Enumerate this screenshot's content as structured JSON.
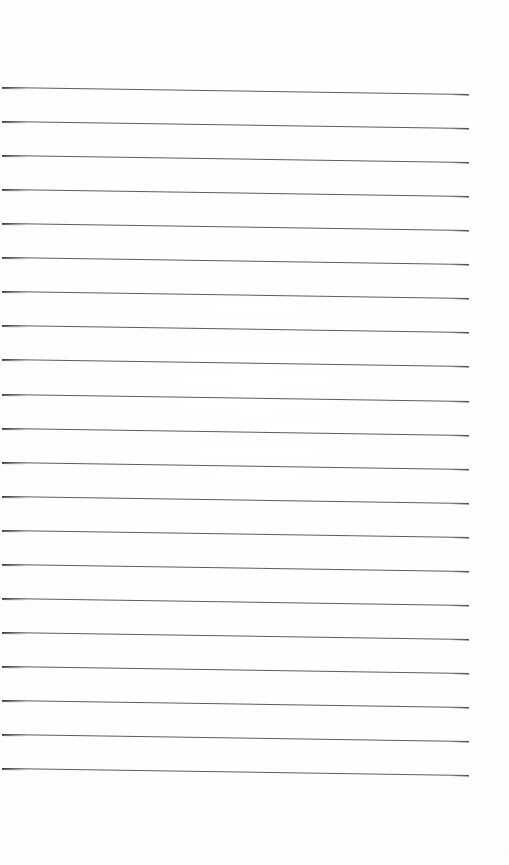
{
  "document": {
    "kind": "scanned-blank-lined-page",
    "page_width": 509,
    "page_height": 865,
    "background_color": "#ffffff",
    "written_text": "",
    "header_text": "",
    "footer_text": "",
    "page_number": "",
    "margin_top": 85,
    "margin_bottom": 85,
    "margin_left": 2,
    "margin_right": 40
  },
  "ruling": {
    "line_color": "#52545a",
    "line_thickness": 1,
    "line_count": 21,
    "line_spacing": 34.05,
    "first_line_y": 87,
    "line_start_x": 2,
    "line_end_x": 469,
    "slant_drop_px": 7,
    "lines": [
      {
        "index": 1,
        "x1": 2,
        "y1": 87.0,
        "x2": 469,
        "y2": 94.0
      },
      {
        "index": 2,
        "x1": 2,
        "y1": 121.1,
        "x2": 469,
        "y2": 128.1
      },
      {
        "index": 3,
        "x1": 2,
        "y1": 155.1,
        "x2": 469,
        "y2": 162.1
      },
      {
        "index": 4,
        "x1": 2,
        "y1": 189.2,
        "x2": 469,
        "y2": 196.2
      },
      {
        "index": 5,
        "x1": 2,
        "y1": 223.2,
        "x2": 469,
        "y2": 230.2
      },
      {
        "index": 6,
        "x1": 2,
        "y1": 257.3,
        "x2": 469,
        "y2": 264.3
      },
      {
        "index": 7,
        "x1": 2,
        "y1": 291.3,
        "x2": 469,
        "y2": 298.3
      },
      {
        "index": 8,
        "x1": 2,
        "y1": 325.4,
        "x2": 469,
        "y2": 332.4
      },
      {
        "index": 9,
        "x1": 2,
        "y1": 359.4,
        "x2": 469,
        "y2": 366.4
      },
      {
        "index": 10,
        "x1": 2,
        "y1": 393.5,
        "x2": 469,
        "y2": 400.5
      },
      {
        "index": 11,
        "x1": 2,
        "y1": 427.5,
        "x2": 469,
        "y2": 434.5
      },
      {
        "index": 12,
        "x1": 2,
        "y1": 461.6,
        "x2": 469,
        "y2": 468.6
      },
      {
        "index": 13,
        "x1": 2,
        "y1": 495.6,
        "x2": 469,
        "y2": 502.6
      },
      {
        "index": 14,
        "x1": 2,
        "y1": 529.7,
        "x2": 469,
        "y2": 536.7
      },
      {
        "index": 15,
        "x1": 2,
        "y1": 563.7,
        "x2": 469,
        "y2": 570.7
      },
      {
        "index": 16,
        "x1": 2,
        "y1": 597.8,
        "x2": 469,
        "y2": 604.8
      },
      {
        "index": 17,
        "x1": 2,
        "y1": 631.8,
        "x2": 469,
        "y2": 638.8
      },
      {
        "index": 18,
        "x1": 2,
        "y1": 665.9,
        "x2": 469,
        "y2": 672.9
      },
      {
        "index": 19,
        "x1": 2,
        "y1": 699.9,
        "x2": 469,
        "y2": 706.9
      },
      {
        "index": 20,
        "x1": 2,
        "y1": 734.0,
        "x2": 469,
        "y2": 741.0
      },
      {
        "index": 21,
        "x1": 2,
        "y1": 768.0,
        "x2": 469,
        "y2": 775.0
      }
    ]
  }
}
